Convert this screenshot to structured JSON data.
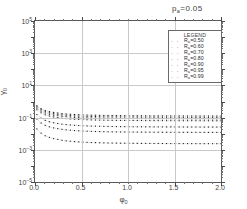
{
  "chart_data": {
    "type": "line",
    "title_base": "p",
    "title_sub": "a",
    "title_rest": "=0.05",
    "xlabel_base": "φ",
    "xlabel_sub": "0",
    "ylabel_base": "γ",
    "ylabel_sub": "0",
    "xlim": [
      0.0,
      2.0
    ],
    "ylim_log10": [
      -5,
      5
    ],
    "yscale": "log",
    "xscale": "linear",
    "grid": true,
    "legend_position": "upper-right",
    "legend_title": "LEGEND",
    "xticks": [
      "0.0",
      "0.5",
      "1.0",
      "1.5",
      "2.0"
    ],
    "xtick_values": [
      0.0,
      0.5,
      1.0,
      1.5,
      2.0
    ],
    "yticks": [
      "10^5",
      "10^3",
      "10^1",
      "10^-1",
      "10^-3",
      "10^-5"
    ],
    "ytick_exponents": [
      5,
      3,
      1,
      -1,
      -3,
      -5
    ],
    "marker": "dotted",
    "series": [
      {
        "name": "R_a=0.50",
        "label_base": "R",
        "label_sub": "a",
        "label_rest": "=0.50",
        "marker_glyph": "· ·",
        "x": [
          0.02,
          0.05,
          0.1,
          0.15,
          0.2,
          0.3,
          0.4,
          0.5,
          0.6,
          0.7,
          0.8,
          0.9,
          1.0,
          1.1,
          1.2,
          1.3,
          1.4,
          1.5,
          1.6,
          1.7,
          1.8,
          1.9,
          2.0
        ],
        "y": [
          0.55,
          0.4,
          0.29,
          0.24,
          0.21,
          0.175,
          0.158,
          0.148,
          0.142,
          0.138,
          0.135,
          0.133,
          0.131,
          0.13,
          0.129,
          0.128,
          0.128,
          0.127,
          0.127,
          0.126,
          0.126,
          0.126,
          0.125
        ]
      },
      {
        "name": "R_a=0.60",
        "label_base": "R",
        "label_sub": "a",
        "label_rest": "=0.60",
        "marker_glyph": "· ·",
        "x": [
          0.02,
          0.05,
          0.1,
          0.15,
          0.2,
          0.3,
          0.4,
          0.5,
          0.6,
          0.7,
          0.8,
          0.9,
          1.0,
          1.1,
          1.2,
          1.3,
          1.4,
          1.5,
          1.6,
          1.7,
          1.8,
          1.9,
          2.0
        ],
        "y": [
          0.47,
          0.34,
          0.245,
          0.2,
          0.175,
          0.145,
          0.13,
          0.122,
          0.117,
          0.113,
          0.111,
          0.109,
          0.108,
          0.107,
          0.106,
          0.105,
          0.105,
          0.104,
          0.104,
          0.104,
          0.103,
          0.103,
          0.103
        ]
      },
      {
        "name": "R_a=0.70",
        "label_base": "R",
        "label_sub": "a",
        "label_rest": "=0.70",
        "marker_glyph": "· ·",
        "x": [
          0.02,
          0.05,
          0.1,
          0.15,
          0.2,
          0.3,
          0.4,
          0.5,
          0.6,
          0.7,
          0.8,
          0.9,
          1.0,
          1.1,
          1.2,
          1.3,
          1.4,
          1.5,
          1.6,
          1.7,
          1.8,
          1.9,
          2.0
        ],
        "y": [
          0.39,
          0.28,
          0.2,
          0.165,
          0.143,
          0.118,
          0.106,
          0.099,
          0.095,
          0.092,
          0.09,
          0.0885,
          0.0875,
          0.0867,
          0.086,
          0.0855,
          0.085,
          0.0846,
          0.0843,
          0.084,
          0.0838,
          0.0836,
          0.0834
        ]
      },
      {
        "name": "R_a=0.80",
        "label_base": "R",
        "label_sub": "a",
        "label_rest": "=0.80",
        "marker_glyph": "· ·",
        "x": [
          0.02,
          0.05,
          0.1,
          0.15,
          0.2,
          0.3,
          0.4,
          0.5,
          0.6,
          0.7,
          0.8,
          0.9,
          1.0,
          1.1,
          1.2,
          1.3,
          1.4,
          1.5,
          1.6,
          1.7,
          1.8,
          1.9,
          2.0
        ],
        "y": [
          0.31,
          0.22,
          0.155,
          0.127,
          0.11,
          0.09,
          0.081,
          0.0755,
          0.0722,
          0.07,
          0.0684,
          0.0672,
          0.0664,
          0.0657,
          0.0652,
          0.0648,
          0.0645,
          0.0642,
          0.064,
          0.0638,
          0.0636,
          0.0635,
          0.0634
        ]
      },
      {
        "name": "R_a=0.90",
        "label_base": "R",
        "label_sub": "a",
        "label_rest": "=0.90",
        "marker_glyph": "· ·",
        "x": [
          0.02,
          0.05,
          0.1,
          0.15,
          0.2,
          0.3,
          0.4,
          0.5,
          0.6,
          0.7,
          0.8,
          0.9,
          1.0,
          1.1,
          1.2,
          1.3,
          1.4,
          1.5,
          1.6,
          1.7,
          1.8,
          1.9,
          2.0
        ],
        "y": [
          0.155,
          0.105,
          0.07,
          0.056,
          0.0475,
          0.0382,
          0.0338,
          0.0313,
          0.0298,
          0.0288,
          0.0281,
          0.0276,
          0.0272,
          0.0269,
          0.0267,
          0.0265,
          0.0263,
          0.0262,
          0.0261,
          0.026,
          0.0259,
          0.0259,
          0.0258
        ]
      },
      {
        "name": "R_a=0.95",
        "label_base": "R",
        "label_sub": "a",
        "label_rest": "=0.95",
        "marker_glyph": "· ·",
        "x": [
          0.02,
          0.05,
          0.1,
          0.15,
          0.2,
          0.3,
          0.4,
          0.5,
          0.6,
          0.7,
          0.8,
          0.9,
          1.0,
          1.1,
          1.2,
          1.3,
          1.4,
          1.5,
          1.6,
          1.7,
          1.8,
          1.9,
          2.0
        ],
        "y": [
          0.082,
          0.053,
          0.0345,
          0.0272,
          0.0229,
          0.0182,
          0.016,
          0.0147,
          0.014,
          0.0135,
          0.0131,
          0.0129,
          0.0127,
          0.0126,
          0.0125,
          0.0124,
          0.0123,
          0.0122,
          0.0122,
          0.0121,
          0.0121,
          0.0121,
          0.012
        ]
      },
      {
        "name": "R_a=0.99",
        "label_base": "R",
        "label_sub": "a",
        "label_rest": "=0.99",
        "marker_glyph": "· ·",
        "x": [
          0.02,
          0.05,
          0.1,
          0.15,
          0.2,
          0.3,
          0.4,
          0.5,
          0.6,
          0.7,
          0.8,
          0.9,
          1.0,
          1.1,
          1.2,
          1.3,
          1.4,
          1.5,
          1.6,
          1.7,
          1.8,
          1.9,
          2.0
        ],
        "y": [
          0.02,
          0.0125,
          0.0078,
          0.006,
          0.005,
          0.0038,
          0.0033,
          0.003,
          0.00283,
          0.00272,
          0.00264,
          0.00258,
          0.00254,
          0.00251,
          0.00249,
          0.00247,
          0.00245,
          0.00244,
          0.00243,
          0.00242,
          0.00241,
          0.00241,
          0.0024
        ]
      }
    ]
  }
}
